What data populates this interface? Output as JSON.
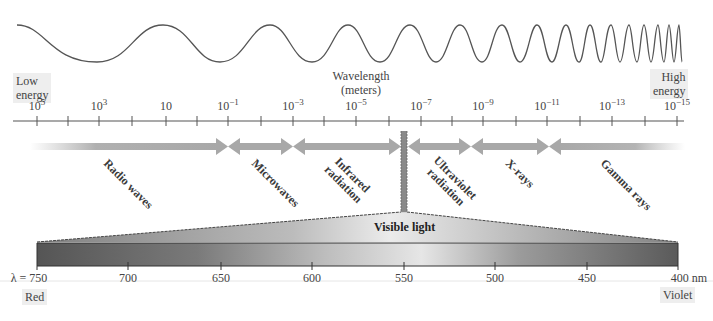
{
  "energy_labels": {
    "low": [
      "Low",
      "energy"
    ],
    "high": [
      "High",
      "energy"
    ]
  },
  "axis": {
    "title_line1": "Wavelength",
    "title_line2": "(meters)",
    "ticks": [
      {
        "base": "10",
        "exp": "5",
        "x": 37
      },
      {
        "base": "10",
        "exp": "3",
        "x": 99
      },
      {
        "base": "10",
        "exp": "",
        "x": 166
      },
      {
        "base": "10",
        "exp": "−1",
        "x": 228
      },
      {
        "base": "10",
        "exp": "−3",
        "x": 293
      },
      {
        "base": "10",
        "exp": "−5",
        "x": 356
      },
      {
        "base": "10",
        "exp": "−7",
        "x": 421
      },
      {
        "base": "10",
        "exp": "−9",
        "x": 483
      },
      {
        "base": "10",
        "exp": "−11",
        "x": 547
      },
      {
        "base": "10",
        "exp": "−13",
        "x": 612
      },
      {
        "base": "10",
        "exp": "−15",
        "x": 677
      }
    ]
  },
  "regions": [
    {
      "name": "Radio waves",
      "lines": [
        "Radio waves"
      ],
      "from_x": 30,
      "to_x": 228
    },
    {
      "name": "Microwaves",
      "lines": [
        "Microwaves"
      ],
      "from_x": 228,
      "to_x": 293
    },
    {
      "name": "Infrared radiation",
      "lines": [
        "Infrared",
        "radiation"
      ],
      "from_x": 293,
      "to_x": 401
    },
    {
      "name": "Ultraviolet radiation",
      "lines": [
        "Ultraviolet",
        "radiation"
      ],
      "from_x": 408,
      "to_x": 471
    },
    {
      "name": "X-rays",
      "lines": [
        "X-rays"
      ],
      "from_x": 471,
      "to_x": 549
    },
    {
      "name": "Gamma rays",
      "lines": [
        "Gamma rays"
      ],
      "from_x": 549,
      "to_x": 685
    }
  ],
  "visible": {
    "label": "Visible light",
    "ticks": [
      {
        "label": "λ = 750",
        "x": 37
      },
      {
        "label": "700",
        "x": 128
      },
      {
        "label": "650",
        "x": 221
      },
      {
        "label": "600",
        "x": 312
      },
      {
        "label": "550",
        "x": 404
      },
      {
        "label": "500",
        "x": 495
      },
      {
        "label": "450",
        "x": 587
      },
      {
        "label": "400 nm",
        "x": 678
      }
    ],
    "end_labels": {
      "left": "Red",
      "right": "Violet"
    }
  },
  "chart_data": {
    "type": "diagram",
    "xlabel": "Wavelength (meters)",
    "wavelength_scale_m": [
      "1e5",
      "1e3",
      "1e1",
      "1e-1",
      "1e-3",
      "1e-5",
      "1e-7",
      "1e-9",
      "1e-11",
      "1e-13",
      "1e-15"
    ],
    "regions_left_to_right": [
      "Radio waves",
      "Microwaves",
      "Infrared radiation",
      "Visible light",
      "Ultraviolet radiation",
      "X-rays",
      "Gamma rays"
    ],
    "visible_scale_nm": [
      750,
      700,
      650,
      600,
      550,
      500,
      450,
      400
    ],
    "visible_ends": {
      "750": "Red",
      "400": "Violet"
    },
    "energy_direction": {
      "left": "Low energy",
      "right": "High energy"
    }
  }
}
